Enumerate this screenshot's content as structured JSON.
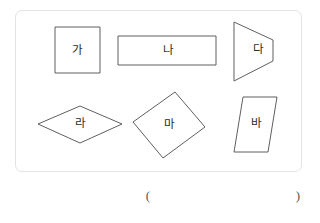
{
  "figure": {
    "panel": {
      "border_color": "#e3e3e3",
      "background_color": "#ffffff"
    },
    "stroke_color": "#5f5f5f",
    "label_color": "#2b2b2b",
    "shapes": [
      {
        "id": "ga",
        "label": "가",
        "kind": "square",
        "points": "55,27 100,27 100,73 55,73",
        "label_x": 77,
        "label_y": 51
      },
      {
        "id": "na",
        "label": "나",
        "kind": "rectangle",
        "points": "118,36 216,36 216,65 118,65",
        "label_x": 168,
        "label_y": 51
      },
      {
        "id": "da",
        "label": "다",
        "kind": "trapezoid",
        "points": "234,22 273,40 273,61 234,81",
        "label_x": 258,
        "label_y": 50
      },
      {
        "id": "ra",
        "label": "라",
        "kind": "rhombus",
        "points": "38,124 80,106 122,124 80,143",
        "label_x": 80,
        "label_y": 124
      },
      {
        "id": "ma",
        "label": "마",
        "kind": "rotated-square",
        "points": "175,92 205,127 163,158 133,122",
        "label_x": 169,
        "label_y": 125
      },
      {
        "id": "ba",
        "label": "바",
        "kind": "parallelogram",
        "points": "243,97 277,97 268,152 234,152",
        "label_x": 256,
        "label_y": 124
      }
    ]
  },
  "answer_line": {
    "open_paren": "(",
    "close_paren": ")",
    "open_x": 148,
    "close_x": 298,
    "y": 195
  }
}
